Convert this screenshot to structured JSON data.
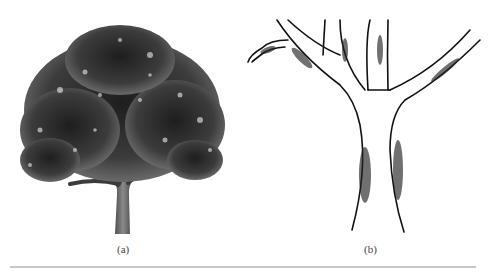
{
  "figure": {
    "panels": [
      {
        "id": "a",
        "label": "(a)",
        "content": "photograph of a full tree with dense leafy canopy and single short trunk splitting into several limbs"
      },
      {
        "id": "b",
        "label": "(b)",
        "content": "line drawing close-up of a tree trunk forking into branches, with a small broken stub on the upper left"
      }
    ]
  },
  "colors": {
    "canopy": "#3a3a3a",
    "trunk": "#555555",
    "ink": "#111111",
    "rule": "#c8c8c8",
    "caption": "#444444"
  }
}
